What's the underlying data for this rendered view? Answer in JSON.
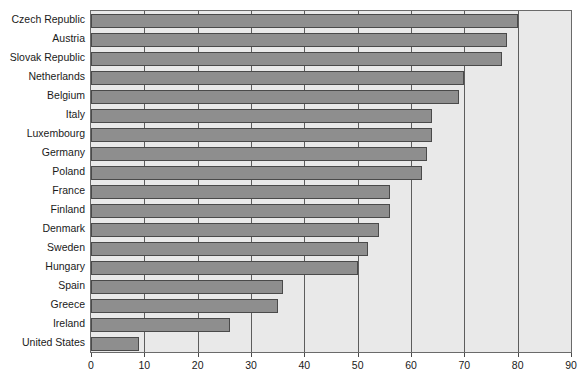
{
  "chart_data": {
    "type": "bar",
    "orientation": "horizontal",
    "title": "",
    "subtitle": "",
    "xlabel": "",
    "ylabel": "",
    "xlim": [
      0,
      90
    ],
    "xticks": [
      0,
      10,
      20,
      30,
      40,
      50,
      60,
      70,
      80,
      90
    ],
    "xtick_labels": [
      "0",
      "10",
      "20",
      "30",
      "40",
      "50",
      "60",
      "70",
      "80",
      "90"
    ],
    "grid": true,
    "grid_axis": "x",
    "legend": false,
    "legend_position": "none",
    "categories": [
      "Czech Republic",
      "Austria",
      "Slovak Republic",
      "Netherlands",
      "Belgium",
      "Italy",
      "Luxembourg",
      "Germany",
      "Poland",
      "France",
      "Finland",
      "Denmark",
      "Sweden",
      "Hungary",
      "Spain",
      "Greece",
      "Ireland",
      "United States"
    ],
    "values": [
      80,
      78,
      77,
      70,
      69,
      64,
      64,
      63,
      62,
      56,
      56,
      54,
      52,
      50,
      36,
      35,
      26,
      9
    ]
  },
  "style": {
    "bar_fill": "#8e8e8e",
    "bar_edge": "#4a4a4a",
    "plot_background": "#e9e9e9",
    "plot_border": "#6a6a6a",
    "gridline_color": "#5d5d5d",
    "page_background": "#ffffff",
    "text_color": "#1a1a1a"
  }
}
